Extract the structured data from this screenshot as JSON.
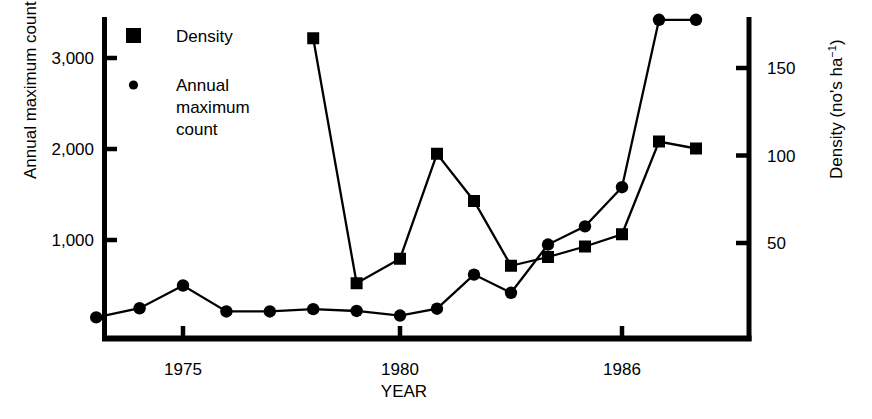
{
  "chart_data": {
    "type": "line",
    "title": "",
    "xlabel": "YEAR",
    "ylabel": "Annual maximum count",
    "y2label": "Density (no's ha−1)",
    "y2label_parts": {
      "main": "Density (no's ha",
      "sup": "−1",
      "tail": ")"
    },
    "x": [
      1973,
      1974,
      1975,
      1976,
      1977,
      1978,
      1979,
      1980,
      1981,
      1982,
      1983,
      1984,
      1985,
      1986,
      1987,
      1988
    ],
    "xlim": [
      1972.2,
      1989.2
    ],
    "ylim": [
      -100,
      3500
    ],
    "y2lim": [
      -7,
      193
    ],
    "xticks": [
      1975,
      1980,
      1986
    ],
    "xticklabels": [
      "1975",
      "1980",
      "1986"
    ],
    "yticks": [
      1000,
      2000,
      3000
    ],
    "yticklabels": [
      "1,000",
      "2,000",
      "3,000"
    ],
    "y2ticks": [
      50,
      100,
      150
    ],
    "y2ticklabels": [
      "50",
      "100",
      "150"
    ],
    "grid": false,
    "legend_position": "upper-left-inside",
    "series": [
      {
        "name": "Density",
        "legend_label": "Density",
        "marker": "square",
        "axis": "right",
        "x": [
          1978,
          1979,
          1980,
          1981,
          1982,
          1983,
          1984,
          1985,
          1986,
          1987,
          1988
        ],
        "values": [
          167,
          27,
          41,
          101,
          74,
          37,
          42,
          48,
          55,
          108,
          104
        ]
      },
      {
        "name": "Annual maximum count",
        "legend_label": "Annual maximum count",
        "marker": "circle",
        "axis": "left",
        "x": [
          1973,
          1974,
          1975,
          1976,
          1977,
          1978,
          1979,
          1980,
          1981,
          1982,
          1983,
          1984,
          1985,
          1986,
          1987,
          1988
        ],
        "values": [
          150,
          250,
          500,
          215,
          215,
          240,
          220,
          170,
          245,
          620,
          420,
          950,
          1150,
          1580,
          3420,
          3420
        ]
      }
    ]
  },
  "legend": {
    "items": [
      {
        "label": "Density",
        "marker": "square"
      },
      {
        "label": "Annual\nmaximum\ncount",
        "marker": "circle",
        "lines": [
          "Annual",
          "maximum",
          "count"
        ]
      }
    ]
  },
  "axes": {
    "left_title": "Annual maximum count",
    "right_title_main": "Density (no's ha",
    "right_title_sup": "−1",
    "right_title_tail": ")",
    "bottom_title": "YEAR"
  }
}
